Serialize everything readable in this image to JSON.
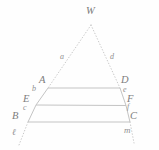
{
  "figure": {
    "background_color": "#fefefe",
    "stroke_color": "#c9c9c9",
    "label_color": "#8a8a8a"
  },
  "apex": {
    "name": "W",
    "label": "W",
    "x": 91,
    "y": 22
  },
  "points": [
    {
      "name": "A",
      "label": "A",
      "x": 48,
      "y": 88,
      "label_x": 40,
      "label_y": 76
    },
    {
      "name": "D",
      "label": "D",
      "x": 120,
      "y": 88,
      "label_x": 122,
      "label_y": 76
    },
    {
      "name": "E",
      "label": "E",
      "x": 36,
      "y": 105,
      "label_x": 24,
      "label_y": 96
    },
    {
      "name": "F",
      "label": "F",
      "x": 126,
      "y": 106,
      "label_x": 128,
      "label_y": 96
    },
    {
      "name": "B",
      "label": "B",
      "x": 28,
      "y": 122,
      "label_x": 13,
      "label_y": 113
    },
    {
      "name": "C",
      "label": "C",
      "x": 130,
      "y": 122,
      "label_x": 131,
      "label_y": 113
    }
  ],
  "segment_labels": [
    {
      "name": "a",
      "label": "a",
      "x": 61,
      "y": 50,
      "description": "upper-left transversal W to A"
    },
    {
      "name": "d",
      "label": "d",
      "x": 111,
      "y": 50,
      "description": "upper-right transversal W to D"
    },
    {
      "name": "b",
      "label": "b",
      "x": 33,
      "y": 89,
      "description": "left side A to E"
    },
    {
      "name": "c",
      "label": "c",
      "x": 24,
      "y": 107,
      "description": "left side E to B"
    },
    {
      "name": "e",
      "label": "e",
      "x": 124,
      "y": 89,
      "description": "right side D to F"
    },
    {
      "name": "f",
      "label": "f",
      "x": 128,
      "y": 105,
      "description": "right side F to C"
    }
  ],
  "line_labels": [
    {
      "name": "ell",
      "label": "ℓ",
      "x": 14,
      "y": 131,
      "description": "left transversal line below B"
    },
    {
      "name": "m",
      "label": "m",
      "x": 126,
      "y": 128,
      "description": "right transversal line below C"
    }
  ],
  "parallel_lines": [
    {
      "name": "line-AD",
      "from": "A",
      "to": "D"
    },
    {
      "name": "line-EF",
      "from": "E",
      "to": "F"
    },
    {
      "name": "line-BC",
      "from": "B",
      "to": "C"
    }
  ],
  "solid_sides": [
    {
      "name": "side-AE",
      "from": "A",
      "to": "E"
    },
    {
      "name": "side-EB",
      "from": "E",
      "to": "B"
    },
    {
      "name": "side-DF",
      "from": "D",
      "to": "F"
    },
    {
      "name": "side-FC",
      "from": "F",
      "to": "C"
    }
  ],
  "dotted_rays": [
    {
      "name": "ray-W-A",
      "x1": 91,
      "y1": 25,
      "x2": 48,
      "y2": 88
    },
    {
      "name": "ray-W-D",
      "x1": 91,
      "y1": 25,
      "x2": 120,
      "y2": 88
    },
    {
      "name": "ray-B-ell",
      "x1": 28,
      "y1": 122,
      "x2": 19,
      "y2": 144
    },
    {
      "name": "ray-C-m",
      "x1": 130,
      "y1": 122,
      "x2": 134,
      "y2": 142
    }
  ]
}
